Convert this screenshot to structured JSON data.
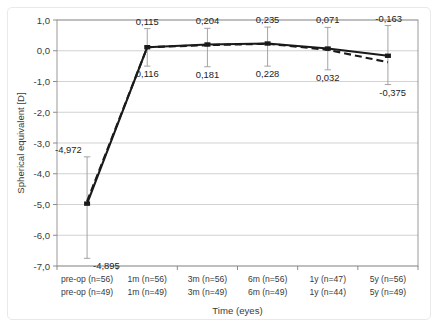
{
  "chart_data": {
    "type": "line",
    "title": "",
    "xlabel": "Time (eyes)",
    "ylabel": "Spherical equivalent [D]",
    "ylim": [
      -7.0,
      1.0
    ],
    "ytick_step": 1.0,
    "grid": true,
    "legend_position": "none",
    "decimal_separator": ",",
    "categories": [
      "pre-op",
      "1m",
      "3m",
      "6m",
      "1y",
      "5y"
    ],
    "x_tick_labels_row1": [
      "pre-op (n=56)",
      "1m (n=56)",
      "3m (n=56)",
      "6m (n=56)",
      "1y (n=47)",
      "5y (n=56)"
    ],
    "x_tick_labels_row2": [
      "pre-op (n=49)",
      "1m (n=49)",
      "3m (n=49)",
      "6m (n=49)",
      "1y (n=44)",
      "5y (n=49)"
    ],
    "ytick_labels": [
      "1,0",
      "0,0",
      "-1,0",
      "-2,0",
      "-3,0",
      "-4,0",
      "-5,0",
      "-6,0",
      "-7,0"
    ],
    "ytick_values": [
      1.0,
      0.0,
      -1.0,
      -2.0,
      -3.0,
      -4.0,
      -5.0,
      -6.0,
      -7.0
    ],
    "series": [
      {
        "name": "n=56 cohort",
        "style": "solid",
        "color": "#1a1a1a",
        "values": [
          -4.972,
          0.115,
          0.204,
          0.235,
          0.071,
          -0.163
        ],
        "labels": [
          "-4,972",
          "0,115",
          "0,204",
          "0,235",
          "0,071",
          "-0,163"
        ],
        "label_position": "above",
        "error_low": [
          -6.75,
          -0.5,
          -0.52,
          -0.5,
          -0.62,
          -1.1
        ],
        "error_high": [
          -3.45,
          0.72,
          0.73,
          0.77,
          0.76,
          0.82
        ]
      },
      {
        "name": "n=49 cohort",
        "style": "dashed",
        "color": "#1a1a1a",
        "values": [
          -4.895,
          0.116,
          0.181,
          0.228,
          0.032,
          -0.375
        ],
        "labels": [
          "-4,895",
          "0,116",
          "0,181",
          "0,228",
          "0,032",
          "-0,375"
        ],
        "label_position": "below"
      }
    ]
  },
  "axes": {
    "y_title": "Spherical equivalent [D]",
    "x_title": "Time (eyes)"
  }
}
